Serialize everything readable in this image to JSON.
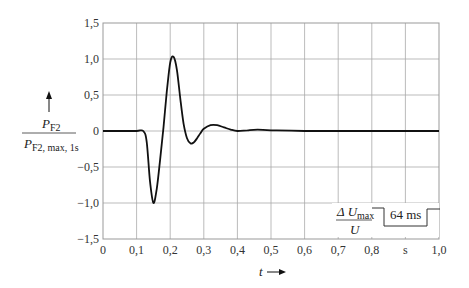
{
  "chart_data": {
    "type": "line",
    "title": "",
    "xlabel": "t",
    "x_unit": "s",
    "ylabel": "P_F2 / P_F2, max, 1s",
    "ylabel_numerator": "P",
    "ylabel_numerator_sub": "F2",
    "ylabel_denominator": "P",
    "ylabel_denominator_sub": "F2, max, 1s",
    "xlim": [
      0,
      1.0
    ],
    "ylim": [
      -1.5,
      1.5
    ],
    "grid": true,
    "x_ticks": [
      "0",
      "0,1",
      "0,2",
      "0,3",
      "0,4",
      "0,5",
      "0,6",
      "0,7",
      "0,8",
      "s",
      "1,0"
    ],
    "y_ticks": [
      "1,5",
      "1,0",
      "0,5",
      "0",
      "−0,5",
      "−1,0",
      "−1,5"
    ],
    "series": [
      {
        "name": "P_F2 / P_F2,max,1s",
        "x": [
          0,
          0.05,
          0.1,
          0.12,
          0.13,
          0.14,
          0.15,
          0.16,
          0.17,
          0.18,
          0.19,
          0.2,
          0.21,
          0.22,
          0.23,
          0.24,
          0.25,
          0.26,
          0.27,
          0.28,
          0.29,
          0.3,
          0.32,
          0.34,
          0.36,
          0.38,
          0.4,
          0.43,
          0.46,
          0.5,
          0.6,
          0.8,
          1.0
        ],
        "values": [
          0,
          0,
          0,
          0,
          -0.15,
          -0.7,
          -1.0,
          -0.8,
          -0.4,
          0.05,
          0.55,
          0.95,
          1.03,
          0.85,
          0.45,
          0.1,
          -0.1,
          -0.17,
          -0.16,
          -0.1,
          -0.03,
          0.03,
          0.08,
          0.08,
          0.05,
          0.02,
          0.0,
          0.01,
          0.02,
          0.01,
          0.0,
          0.0,
          0.0
        ]
      }
    ],
    "annotations": [
      {
        "text": "ΔU_max / U",
        "numerator": "Δ U",
        "numerator_sub": "max",
        "denominator": "U",
        "type": "inset-pulse"
      },
      {
        "text": "64 ms",
        "type": "pulse-duration"
      }
    ]
  },
  "labels": {
    "x_axis": "t",
    "inset_numerator": "Δ U",
    "inset_numerator_sub": "max",
    "inset_denominator": "U",
    "inset_duration": "64 ms"
  }
}
